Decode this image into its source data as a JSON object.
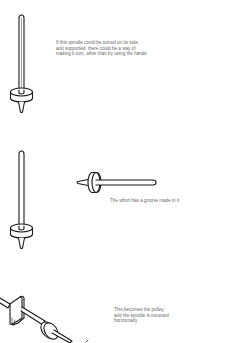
{
  "panels": [
    {
      "id": "upright-spindle",
      "caption_lines": [
        "If this spindle could be turned on its side,",
        "and supported, there could be a way of",
        "making it turn, other than by using the hands"
      ]
    },
    {
      "id": "horizontal-spindle",
      "caption_lines": [
        "The whorl has a groove made in it"
      ]
    },
    {
      "id": "mounted-spindle",
      "caption_lines": [
        "This becomes the pulley,",
        "and the spindle is mounted",
        "horizontally"
      ]
    }
  ],
  "colors": {
    "line": "#1a1a1a",
    "caption": "#6a6a6a",
    "background": "#ffffff"
  }
}
